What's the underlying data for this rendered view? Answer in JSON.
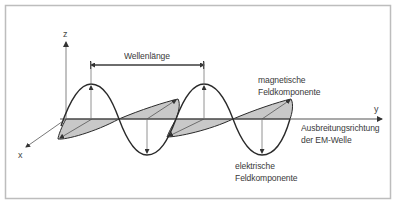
{
  "diagram": {
    "axes": {
      "z": "z",
      "y": "y",
      "x": "x"
    },
    "labels": {
      "wavelength": "Wellenlänge",
      "magnetic_line1": "magnetische",
      "magnetic_line2": "Feldkomponente",
      "electric_line1": "elektrische",
      "electric_line2": "Feldkomponente",
      "propagation_line1": "Ausbreitungsrichtung",
      "propagation_line2": "der EM-Welle"
    },
    "colors": {
      "frame": "#bdbdbd",
      "axis": "#555555",
      "wave": "#2a2a2a",
      "magnetic_fill": "#c4c4c4"
    }
  }
}
